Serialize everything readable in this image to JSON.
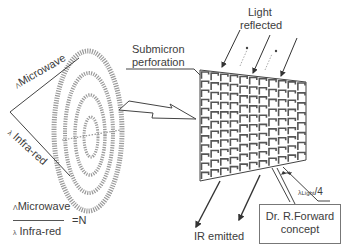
{
  "diagram": {
    "labels": {
      "light_reflected_line1": "Light",
      "light_reflected_line2": "reflected",
      "submicron_line1": "Submicron",
      "submicron_line2": "perforation",
      "microwave_symbol": "Λ",
      "microwave": "Microwave",
      "infrared_symbol": "λ",
      "infrared": "Infra-red",
      "lambda_light_symbol": "λ",
      "lambda_light_sub": "Light",
      "lambda_light_div": "/4",
      "ir_emitted": "IR emitted",
      "concept_line1": "Dr. R.Forward",
      "concept_line2": "concept"
    },
    "formula": {
      "numerator_symbol": "Λ",
      "numerator": "Microwave",
      "denominator_symbol": "λ",
      "denominator": "Infra-red",
      "result": "=N"
    },
    "colors": {
      "line": "#4a4a4a",
      "grid": "#555555",
      "dotted": "#9a9a9a",
      "text": "#3c3c3c"
    }
  }
}
